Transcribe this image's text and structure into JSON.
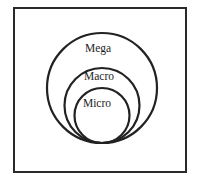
{
  "diagram": {
    "frame": {
      "x": 14,
      "y": 8,
      "width": 172,
      "height": 164,
      "stroke": "#2a2a2a",
      "stroke_width": 2
    },
    "circles": [
      {
        "name": "Mega",
        "label": "Mega",
        "cx": 102,
        "cy": 88,
        "r": 55,
        "label_y": 52
      },
      {
        "name": "Macro",
        "label": "Macro",
        "cx": 102,
        "cy": 105.5,
        "r": 37.5,
        "label_y": 80
      },
      {
        "name": "Micro",
        "label": "Micro",
        "cx": 102,
        "cy": 115.5,
        "r": 27.5,
        "label_y": 107
      }
    ],
    "stroke_color": "#222222",
    "text_color": "#1e1e1e"
  }
}
